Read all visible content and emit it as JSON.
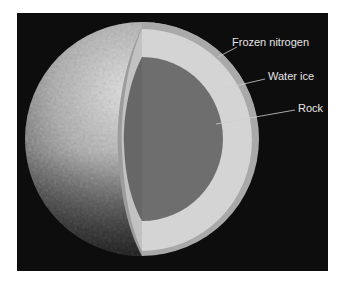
{
  "diagram": {
    "background_color": "#0d0d0d",
    "layers": [
      {
        "name": "Frozen nitrogen",
        "color": "#a9a9a9"
      },
      {
        "name": "Water ice",
        "color": "#d4d4d4"
      },
      {
        "name": "Rock",
        "color": "#6e6e6e"
      }
    ],
    "labels": {
      "frozen_nitrogen": "Frozen nitrogen",
      "water_ice": "Water ice",
      "rock": "Rock"
    }
  }
}
